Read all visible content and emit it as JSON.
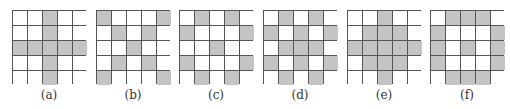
{
  "colors": {
    "shaded": "#c4c4c4",
    "empty": "#ffffff",
    "gridline": "#555555"
  },
  "panels": [
    {
      "label": "(a)",
      "left": 12,
      "cells": [
        [
          0,
          0,
          1,
          0,
          0
        ],
        [
          0,
          0,
          1,
          0,
          0
        ],
        [
          1,
          1,
          1,
          1,
          1
        ],
        [
          0,
          0,
          1,
          0,
          0
        ],
        [
          0,
          0,
          1,
          0,
          0
        ]
      ]
    },
    {
      "label": "(b)",
      "left": 96,
      "cells": [
        [
          1,
          0,
          0,
          0,
          1
        ],
        [
          0,
          1,
          0,
          1,
          0
        ],
        [
          0,
          0,
          1,
          0,
          0
        ],
        [
          0,
          1,
          0,
          1,
          0
        ],
        [
          1,
          0,
          0,
          0,
          1
        ]
      ]
    },
    {
      "label": "(c)",
      "left": 179,
      "cells": [
        [
          0,
          1,
          0,
          1,
          0
        ],
        [
          1,
          0,
          0,
          0,
          1
        ],
        [
          0,
          0,
          1,
          0,
          0
        ],
        [
          1,
          0,
          0,
          0,
          1
        ],
        [
          0,
          1,
          0,
          1,
          0
        ]
      ]
    },
    {
      "label": "(d)",
      "left": 263,
      "cells": [
        [
          0,
          1,
          0,
          1,
          0
        ],
        [
          1,
          0,
          1,
          0,
          1
        ],
        [
          0,
          1,
          1,
          1,
          0
        ],
        [
          1,
          0,
          1,
          0,
          1
        ],
        [
          0,
          1,
          0,
          1,
          0
        ]
      ]
    },
    {
      "label": "(e)",
      "left": 347,
      "cells": [
        [
          0,
          0,
          1,
          0,
          0
        ],
        [
          0,
          1,
          1,
          1,
          0
        ],
        [
          1,
          1,
          1,
          1,
          1
        ],
        [
          0,
          1,
          1,
          1,
          0
        ],
        [
          0,
          0,
          1,
          0,
          0
        ]
      ]
    },
    {
      "label": "(f)",
      "left": 430,
      "cells": [
        [
          0,
          1,
          1,
          1,
          0
        ],
        [
          1,
          0,
          0,
          0,
          1
        ],
        [
          1,
          0,
          1,
          0,
          1
        ],
        [
          1,
          0,
          0,
          0,
          1
        ],
        [
          0,
          1,
          1,
          1,
          0
        ]
      ]
    }
  ]
}
